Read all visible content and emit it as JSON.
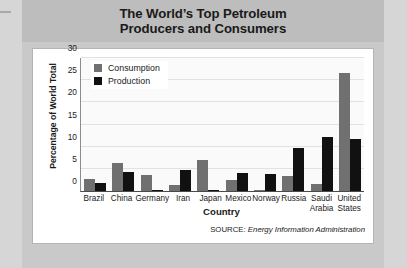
{
  "title": {
    "line1": "The World’s Top Petroleum",
    "line2": "Producers and Consumers"
  },
  "source": {
    "prefix": "SOURCE:",
    "text": "Energy Information Administration"
  },
  "legend": {
    "items": [
      {
        "label": "Consumption",
        "color": "#707070"
      },
      {
        "label": "Production",
        "color": "#111111"
      }
    ]
  },
  "colors": {
    "consumption": "#707070",
    "production": "#111111",
    "header_band": "#bdbdbd",
    "card": "#c9c9c9",
    "page": "#d6d6d6",
    "plot_bg": "#fafafa"
  },
  "chart_data": {
    "type": "bar",
    "title": "The World’s Top Petroleum Producers and Consumers",
    "xlabel": "Country",
    "ylabel": "Percentage of World Total",
    "ylim": [
      0,
      30
    ],
    "yticks": [
      0,
      5,
      10,
      15,
      20,
      25,
      30
    ],
    "grid": true,
    "legend_position": "top-left",
    "categories": [
      "Brazil",
      "China",
      "Germany",
      "Iran",
      "Japan",
      "Mexico",
      "Norway",
      "Russia",
      "Saudi Arabia",
      "United States"
    ],
    "series": [
      {
        "name": "Consumption",
        "color": "#707070",
        "values": [
          2.6,
          6.3,
          3.5,
          1.4,
          6.9,
          2.4,
          0.3,
          3.3,
          1.5,
          26.6
        ]
      },
      {
        "name": "Production",
        "color": "#111111",
        "values": [
          1.7,
          4.2,
          0.2,
          4.8,
          0.1,
          4.0,
          3.9,
          9.7,
          12.1,
          11.8
        ]
      }
    ]
  }
}
